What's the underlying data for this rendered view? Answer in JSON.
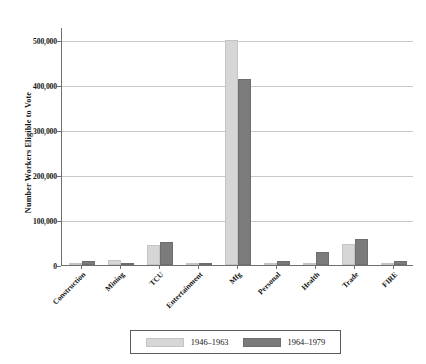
{
  "chart_data": {
    "type": "bar",
    "title": "",
    "xlabel": "",
    "ylabel": "Number Workers Eligible to Vote",
    "ylim": [
      0,
      530000
    ],
    "yticks": [
      0,
      100000,
      200000,
      300000,
      400000,
      500000
    ],
    "ytick_labels": [
      "0",
      "100,000",
      "200,000",
      "300,000",
      "400,000",
      "500,000"
    ],
    "grid": true,
    "legend_position": "bottom",
    "categories": [
      "Construction",
      "Mining",
      "TCU",
      "Entertainment",
      "Mfg",
      "Personal",
      "Health",
      "Trade",
      "FIRE"
    ],
    "series": [
      {
        "name": "1946–1963",
        "color": "#d6d6d6",
        "values": [
          3000,
          11000,
          45000,
          1000,
          500000,
          0,
          1000,
          47000,
          4000
        ]
      },
      {
        "name": "1964–1979",
        "color": "#7b7b7b",
        "values": [
          9000,
          5000,
          52000,
          1000,
          415000,
          9000,
          28000,
          58000,
          8000
        ]
      }
    ]
  },
  "legend": {
    "items": [
      {
        "label": "1946–1963",
        "swatch": "a"
      },
      {
        "label": "1964–1979",
        "swatch": "b"
      }
    ]
  }
}
